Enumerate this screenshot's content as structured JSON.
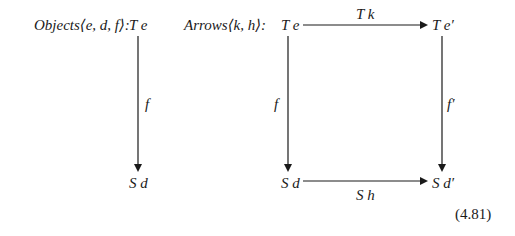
{
  "objects": {
    "label": "Objects",
    "tuple": "⟨e, d, f⟩:",
    "top": "T e",
    "arrow_label": "f",
    "bottom": "S d"
  },
  "arrows": {
    "label": "Arrows",
    "tuple": "⟨k, h⟩:",
    "top_left": "T e",
    "top_right": "T e′",
    "bottom_left": "S d",
    "bottom_right": "S d′",
    "top_arrow_label": "T k",
    "bottom_arrow_label": "S h",
    "left_arrow_label": "f",
    "right_arrow_label": "f′"
  },
  "equation_number": "(4.81)"
}
